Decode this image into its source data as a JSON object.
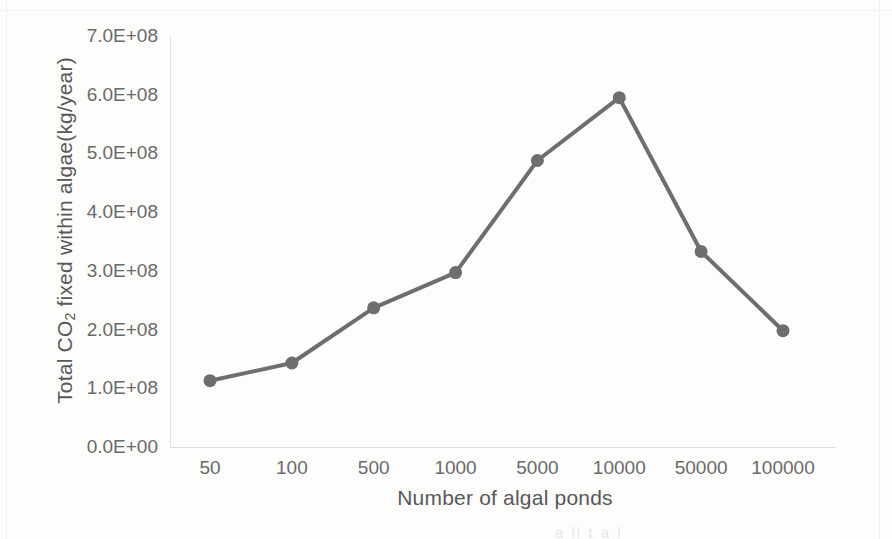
{
  "chart_data": {
    "type": "line",
    "title": "",
    "xlabel": "Number of algal ponds",
    "ylabel": "Total CO2 fixed within algae(kg/year)",
    "ylabel_parts": {
      "before": "Total CO",
      "subscript": "2",
      "after": " fixed within algae(kg/year)"
    },
    "categories": [
      "50",
      "100",
      "500",
      "1000",
      "5000",
      "10000",
      "50000",
      "100000"
    ],
    "values": [
      113000000,
      143000000,
      237000000,
      297000000,
      488000000,
      595000000,
      333000000,
      198000000
    ],
    "series": [
      {
        "name": "Total CO2 fixed within algae",
        "values": [
          113000000,
          143000000,
          237000000,
          297000000,
          488000000,
          595000000,
          333000000,
          198000000
        ]
      }
    ],
    "ylim": [
      0,
      700000000
    ],
    "ytick_values": [
      0,
      100000000,
      200000000,
      300000000,
      400000000,
      500000000,
      600000000,
      700000000
    ],
    "ytick_labels": [
      "0.0E+00",
      "1.0E+08",
      "2.0E+08",
      "3.0E+08",
      "4.0E+08",
      "5.0E+08",
      "6.0E+08",
      "7.0E+08"
    ],
    "grid": false,
    "legend": "none",
    "line_color": "#6e6e6e",
    "marker_color": "#6e6e6e",
    "marker_shape": "circle",
    "axis_color": "#e0dedc",
    "text_color": "#5d5d5d",
    "background": "#fdfdfc"
  },
  "page_bleed_text": "a    ll       t       a        l"
}
